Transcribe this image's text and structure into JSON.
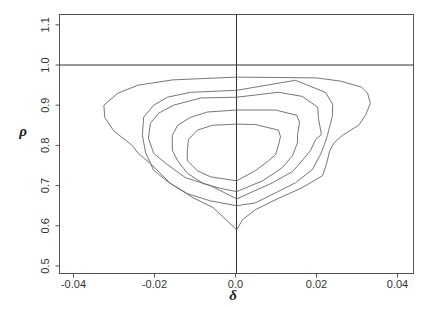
{
  "chart_data": {
    "type": "contour",
    "title": "",
    "xlabel": "δ",
    "ylabel": "ρ",
    "xlim": [
      -0.0415,
      0.0435
    ],
    "ylim": [
      0.478,
      1.122
    ],
    "x_ticks": [
      -0.04,
      -0.02,
      0.0,
      0.02,
      0.04
    ],
    "x_tick_labels": [
      "-0.04",
      "-0.02",
      "0.0",
      "0.02",
      "0.04"
    ],
    "y_ticks": [
      0.5,
      0.6,
      0.7,
      0.8,
      0.9,
      1.0,
      1.1
    ],
    "y_tick_labels": [
      "0.5",
      "0.6",
      "0.7",
      "0.8",
      "0.9",
      "1.0",
      "1.1"
    ],
    "grid": false,
    "legend": null,
    "reference_lines": [
      {
        "orientation": "horizontal",
        "y": 1.0
      },
      {
        "orientation": "vertical",
        "x": 0.0
      }
    ],
    "contours": [
      {
        "level_index": 1,
        "note": "outermost contour",
        "points": [
          [
            0.0003,
            0.97
          ],
          [
            -0.0155,
            0.963
          ],
          [
            -0.024,
            0.95
          ],
          [
            -0.029,
            0.93
          ],
          [
            -0.0325,
            0.9
          ],
          [
            -0.0323,
            0.87
          ],
          [
            -0.03,
            0.835
          ],
          [
            -0.028,
            0.82
          ],
          [
            -0.0255,
            0.8
          ],
          [
            -0.024,
            0.78
          ],
          [
            -0.021,
            0.755
          ],
          [
            -0.016,
            0.705
          ],
          [
            -0.0105,
            0.67
          ],
          [
            -0.0055,
            0.645
          ],
          [
            0.0003,
            0.59
          ],
          [
            0.0017,
            0.615
          ],
          [
            0.0049,
            0.64
          ],
          [
            0.0099,
            0.665
          ],
          [
            0.0165,
            0.695
          ],
          [
            0.0215,
            0.725
          ],
          [
            0.0225,
            0.755
          ],
          [
            0.0232,
            0.785
          ],
          [
            0.0242,
            0.805
          ],
          [
            0.0264,
            0.825
          ],
          [
            0.0304,
            0.85
          ],
          [
            0.0321,
            0.875
          ],
          [
            0.0333,
            0.905
          ],
          [
            0.0326,
            0.93
          ],
          [
            0.0311,
            0.945
          ],
          [
            0.0259,
            0.96
          ],
          [
            0.02,
            0.968
          ],
          [
            0.0003,
            0.97
          ]
        ]
      },
      {
        "level_index": 2,
        "points": [
          [
            0.0003,
            0.937
          ],
          [
            -0.0111,
            0.932
          ],
          [
            -0.0168,
            0.92
          ],
          [
            -0.0202,
            0.9
          ],
          [
            -0.0227,
            0.87
          ],
          [
            -0.023,
            0.825
          ],
          [
            -0.0222,
            0.782
          ],
          [
            -0.0202,
            0.738
          ],
          [
            -0.0165,
            0.708
          ],
          [
            -0.0119,
            0.68
          ],
          [
            -0.0062,
            0.662
          ],
          [
            0.0003,
            0.65
          ],
          [
            0.0049,
            0.657
          ],
          [
            0.0099,
            0.682
          ],
          [
            0.0148,
            0.707
          ],
          [
            0.019,
            0.74
          ],
          [
            0.021,
            0.778
          ],
          [
            0.022,
            0.803
          ],
          [
            0.0227,
            0.825
          ],
          [
            0.0239,
            0.872
          ],
          [
            0.024,
            0.902
          ],
          [
            0.0222,
            0.932
          ],
          [
            0.0148,
            0.962
          ],
          [
            0.0003,
            0.937
          ]
        ]
      },
      {
        "level_index": 3,
        "points": [
          [
            0.0003,
            0.92
          ],
          [
            -0.0086,
            0.918
          ],
          [
            -0.0153,
            0.9
          ],
          [
            -0.019,
            0.88
          ],
          [
            -0.021,
            0.855
          ],
          [
            -0.0215,
            0.818
          ],
          [
            -0.0202,
            0.78
          ],
          [
            -0.0168,
            0.752
          ],
          [
            -0.0124,
            0.72
          ],
          [
            -0.0062,
            0.7
          ],
          [
            0.0003,
            0.667
          ],
          [
            0.0091,
            0.707
          ],
          [
            0.0141,
            0.735
          ],
          [
            0.0156,
            0.752
          ],
          [
            0.0185,
            0.787
          ],
          [
            0.0198,
            0.815
          ],
          [
            0.0212,
            0.827
          ],
          [
            0.0205,
            0.867
          ],
          [
            0.0203,
            0.895
          ],
          [
            0.0165,
            0.922
          ],
          [
            0.0106,
            0.932
          ],
          [
            0.0003,
            0.92
          ]
        ]
      },
      {
        "level_index": 4,
        "points": [
          [
            0.0003,
            0.888
          ],
          [
            -0.0069,
            0.883
          ],
          [
            -0.0111,
            0.87
          ],
          [
            -0.0143,
            0.85
          ],
          [
            -0.0156,
            0.825
          ],
          [
            -0.0156,
            0.788
          ],
          [
            -0.0143,
            0.762
          ],
          [
            -0.0118,
            0.73
          ],
          [
            -0.0079,
            0.705
          ],
          [
            -0.0037,
            0.693
          ],
          [
            0.0003,
            0.685
          ],
          [
            0.0067,
            0.712
          ],
          [
            0.0116,
            0.745
          ],
          [
            0.0141,
            0.775
          ],
          [
            0.0153,
            0.807
          ],
          [
            0.0153,
            0.825
          ],
          [
            0.0158,
            0.858
          ],
          [
            0.0151,
            0.875
          ],
          [
            0.0099,
            0.888
          ],
          [
            0.0003,
            0.888
          ]
        ]
      },
      {
        "level_index": 5,
        "note": "innermost contour",
        "points": [
          [
            0.0003,
            0.853
          ],
          [
            -0.0057,
            0.85
          ],
          [
            -0.0094,
            0.838
          ],
          [
            -0.0116,
            0.815
          ],
          [
            -0.0119,
            0.787
          ],
          [
            -0.0119,
            0.762
          ],
          [
            -0.0094,
            0.737
          ],
          [
            -0.0062,
            0.722
          ],
          [
            0.0003,
            0.712
          ],
          [
            0.0049,
            0.737
          ],
          [
            0.0082,
            0.762
          ],
          [
            0.0099,
            0.777
          ],
          [
            0.0106,
            0.8
          ],
          [
            0.0111,
            0.822
          ],
          [
            0.0106,
            0.838
          ],
          [
            0.0049,
            0.852
          ],
          [
            0.0003,
            0.853
          ]
        ]
      }
    ]
  },
  "axes": {
    "x_label": "δ",
    "y_label": "ρ",
    "x_tick_labels": [
      "-0.04",
      "-0.02",
      "0.0",
      "0.02",
      "0.04"
    ],
    "y_tick_labels": [
      "0.5",
      "0.6",
      "0.7",
      "0.8",
      "0.9",
      "1.0",
      "1.1"
    ]
  },
  "colors": {
    "line": "#666666",
    "frame": "#555555",
    "reference": "#333333",
    "background": "#ffffff"
  }
}
